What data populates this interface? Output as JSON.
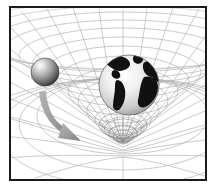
{
  "figure": {
    "alt_text": "A rubber-sheet grid warped into a gravity well by the Earth, with a small sphere falling inward along a curved arrow",
    "frame_color": "#1b1b1b",
    "background_color": "#ffffff",
    "grid_color": "#a8a8a8",
    "grid_color_dark": "#6f6f6f",
    "arrow_color": "#9a9a9a",
    "arrow_color_dark": "#7d7d7d",
    "earth_land_color": "#111111",
    "earth_ocean_color": "#e8e8e8",
    "small_sphere_color": "#8a8a8a"
  },
  "elements": {
    "grid": {
      "name": "spacetime-grid",
      "label": "Warped spacetime grid",
      "rings": 11,
      "radials": 24,
      "well_depth_px": 62
    },
    "earth": {
      "name": "earth-sphere",
      "label": "Earth",
      "center_x": 118,
      "center_y": 77,
      "radius": 30
    },
    "small_sphere": {
      "name": "small-sphere",
      "label": "Infalling mass",
      "center_x": 34,
      "center_y": 64,
      "radius": 14
    },
    "arrow": {
      "name": "infall-arrow",
      "label": "Infall trajectory",
      "start_x": 32,
      "start_y": 88,
      "end_x": 66,
      "end_y": 130
    }
  }
}
